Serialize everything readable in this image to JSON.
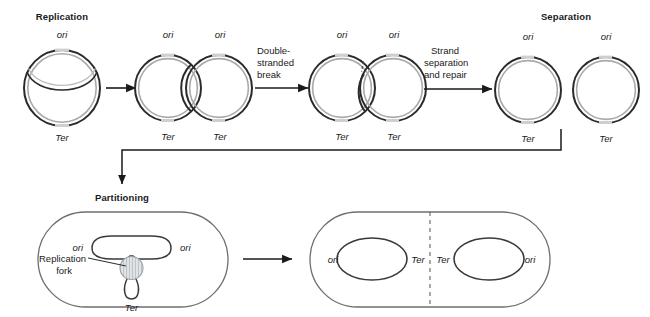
{
  "figure": {
    "title_stages": {
      "replication": "Replication",
      "separation": "Separation",
      "partitioning": "Partitioning"
    },
    "arrow_labels": {
      "break_line1": "Double-",
      "break_line2": "stranded",
      "break_line3": "break",
      "repair_line1": "Strand",
      "repair_line2": "separation",
      "repair_line3": "and repair"
    },
    "callouts": {
      "replication_fork_line1": "Replication",
      "replication_fork_line2": "fork"
    },
    "site_labels": {
      "ori": "ori",
      "ter": "Ter"
    },
    "colors": {
      "ink": "#1a1a1a",
      "strand_dark": "#2b2b2b",
      "strand_light": "#b9b9b9",
      "cell_outline": "#6e6e6e",
      "fork_fill": "#d9dde0",
      "background": "#ffffff"
    },
    "stages": [
      {
        "name": "replication-theta",
        "cx": 62,
        "cy": 88,
        "r": 38,
        "labels": {
          "top": [
            "ori"
          ],
          "bottom": [
            "Ter"
          ]
        }
      },
      {
        "name": "catenated-pair",
        "circles": [
          {
            "cx": 168,
            "cy": 88,
            "r": 33
          },
          {
            "cx": 218,
            "cy": 88,
            "r": 33
          }
        ],
        "labels": {
          "top": [
            "ori",
            "ori"
          ],
          "bottom": [
            "Ter",
            "Ter"
          ]
        }
      },
      {
        "name": "catenated-pair-with-break",
        "circles": [
          {
            "cx": 342,
            "cy": 88,
            "r": 33
          },
          {
            "cx": 392,
            "cy": 88,
            "r": 33
          }
        ],
        "labels": {
          "top": [
            "ori",
            "ori"
          ],
          "bottom": [
            "Ter",
            "Ter"
          ]
        }
      },
      {
        "name": "separated-circles",
        "circles": [
          {
            "cx": 528,
            "cy": 90,
            "r": 33
          },
          {
            "cx": 606,
            "cy": 90,
            "r": 33
          }
        ],
        "labels": {
          "top": [
            "ori",
            "ori"
          ],
          "bottom": [
            "Ter",
            "Ter"
          ]
        }
      }
    ],
    "cells": [
      {
        "name": "partitioning-cell",
        "labels": {
          "left_ori": "ori",
          "right_ori": "ori",
          "bottom_ter": "Ter"
        }
      },
      {
        "name": "divided-cell",
        "labels": {
          "left_ori": "ori",
          "left_ter": "Ter",
          "right_ter": "Ter",
          "right_ori": "ori"
        },
        "septum": "dashed-division-line"
      }
    ]
  }
}
